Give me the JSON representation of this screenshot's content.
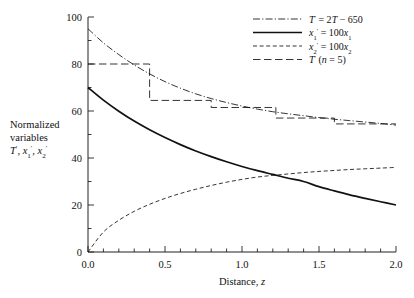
{
  "chart_data": {
    "type": "line",
    "title": "",
    "xlabel": "Distance, z",
    "ylabel_lines": [
      "Normalized",
      "variables",
      "T', x'1, x'2"
    ],
    "xlim": [
      0.0,
      2.0
    ],
    "ylim": [
      0,
      100
    ],
    "grid": false,
    "legend_position": "top-right",
    "x_ticks": [
      "0.0",
      "0.5",
      "1.0",
      "1.5",
      "2.0"
    ],
    "x_tick_values": [
      0.0,
      0.5,
      1.0,
      1.5,
      2.0
    ],
    "x_minor_step": 0.1,
    "y_ticks": [
      "0",
      "20",
      "40",
      "60",
      "80",
      "100"
    ],
    "y_tick_values": [
      0,
      20,
      40,
      60,
      80,
      100
    ],
    "y_minor_step": 10,
    "series": [
      {
        "name": "T' = 2T - 650",
        "legend_label_parts": {
          "pre": "T",
          "prime": "′",
          "eq": " = 2",
          "var": "T",
          "tail": " − 650"
        },
        "style": "dash-dot",
        "x": [
          0.0,
          0.1,
          0.2,
          0.3,
          0.4,
          0.5,
          0.6,
          0.7,
          0.8,
          0.9,
          1.0,
          1.1,
          1.2,
          1.3,
          1.4,
          1.5,
          1.6,
          1.7,
          1.8,
          1.9,
          2.0
        ],
        "values": [
          95.0,
          89.0,
          84.0,
          79.6,
          75.8,
          72.5,
          69.7,
          67.3,
          65.3,
          63.6,
          62.1,
          60.8,
          59.7,
          58.8,
          58.0,
          57.2,
          56.5,
          55.9,
          55.3,
          54.7,
          54.0
        ]
      },
      {
        "name": "x'1 = 100x1",
        "style": "solid",
        "x": [
          0.0,
          0.1,
          0.2,
          0.3,
          0.4,
          0.5,
          0.6,
          0.7,
          0.8,
          0.9,
          1.0,
          1.1,
          1.2,
          1.3,
          1.4,
          1.5,
          1.6,
          1.7,
          1.8,
          1.9,
          2.0
        ],
        "values": [
          70.0,
          64.6,
          59.9,
          55.7,
          52.0,
          48.7,
          45.7,
          43.0,
          40.6,
          38.4,
          36.4,
          34.6,
          33.0,
          31.4,
          30.0,
          27.8,
          26.0,
          24.3,
          22.8,
          21.4,
          20.0
        ]
      },
      {
        "name": "x'2 = 100x2",
        "style": "dashed",
        "x": [
          0.0,
          0.1,
          0.2,
          0.3,
          0.4,
          0.5,
          0.6,
          0.7,
          0.8,
          0.9,
          1.0,
          1.1,
          1.2,
          1.3,
          1.4,
          1.5,
          1.6,
          1.7,
          1.8,
          1.9,
          2.0
        ],
        "values": [
          0.0,
          8.5,
          13.5,
          17.3,
          20.3,
          22.8,
          24.9,
          26.7,
          28.3,
          29.7,
          30.9,
          31.9,
          32.6,
          33.2,
          33.8,
          34.3,
          34.7,
          35.1,
          35.4,
          35.7,
          36.0
        ]
      },
      {
        "name": "T' (n = 5)",
        "style": "long-dash-step",
        "step_edges": [
          0.0,
          0.4,
          0.8,
          1.22,
          1.6,
          2.0
        ],
        "step_values": [
          80.0,
          64.5,
          61.5,
          57.0,
          54.5
        ]
      }
    ],
    "annotations": []
  },
  "legend": {
    "items": [
      {
        "key": "legend-item-t-prime",
        "style": "dash-dot"
      },
      {
        "key": "legend-item-x1",
        "style": "solid"
      },
      {
        "key": "legend-item-x2",
        "style": "dashed"
      },
      {
        "key": "legend-item-t-n5",
        "style": "long-dash"
      }
    ]
  }
}
